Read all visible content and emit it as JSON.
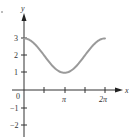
{
  "chart_data": {
    "type": "line",
    "title": "",
    "function": "y = 2 + cos(x)",
    "xlabel": "x",
    "ylabel": "y",
    "x_range": [
      0,
      6.2832
    ],
    "xlim": [
      0,
      6.2832
    ],
    "ylim": [
      -2,
      3
    ],
    "x_ticks": [
      {
        "value": 0,
        "label": "0"
      },
      {
        "value": 1.5708,
        "label": ""
      },
      {
        "value": 3.1416,
        "label": "π"
      },
      {
        "value": 4.7124,
        "label": ""
      },
      {
        "value": 6.2832,
        "label": "2π"
      }
    ],
    "y_ticks": [
      {
        "value": 3,
        "label": "3"
      },
      {
        "value": 2,
        "label": "2"
      },
      {
        "value": 1,
        "label": "1"
      },
      {
        "value": -1,
        "label": "−1"
      },
      {
        "value": -2,
        "label": "−2"
      }
    ],
    "series": [
      {
        "name": "y = 2 + cos x",
        "color": "#9a9a9a",
        "x": [
          0,
          0.7854,
          1.5708,
          2.3562,
          3.1416,
          3.927,
          4.7124,
          5.4978,
          6.2832
        ],
        "values": [
          3,
          2.71,
          2,
          1.29,
          1,
          1.29,
          2,
          2.71,
          3
        ]
      }
    ],
    "grid": false,
    "legend": null
  },
  "labels": {
    "x_axis": "x",
    "y_axis": "y",
    "origin": "0",
    "pi": "π",
    "two_pi": "2π",
    "y3": "3",
    "y2": "2",
    "y1": "1",
    "ym1": "−1",
    "ym2": "−2"
  },
  "colors": {
    "axis": "#333333",
    "curve": "#9a9a9a"
  }
}
